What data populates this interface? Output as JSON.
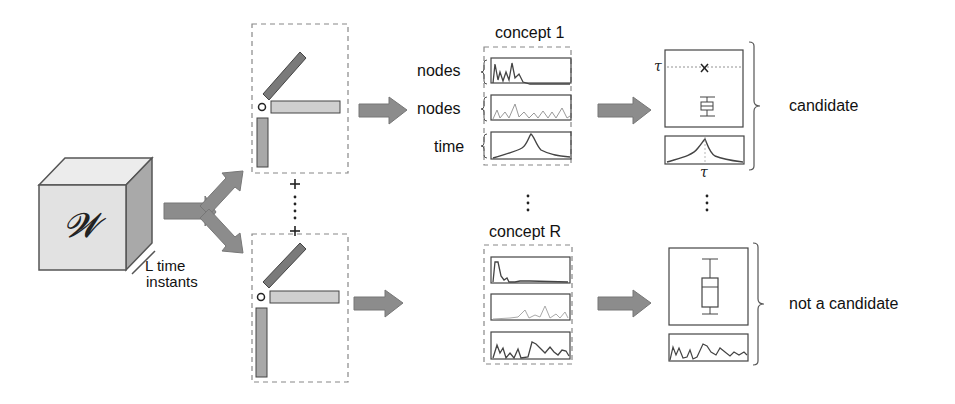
{
  "tensor": {
    "symbol": "𝓦",
    "mode_label": "L time\ninstants",
    "mode_label_line1": "L time",
    "mode_label_line2": "instants"
  },
  "decomposition": {
    "plus_symbol": "+",
    "ellipsis": "⋮",
    "components_shown": 2
  },
  "concepts": [
    {
      "title": "concept 1",
      "factor_labels": [
        "nodes",
        "nodes",
        "time"
      ],
      "outcome": "candidate"
    },
    {
      "title": "concept R",
      "factor_labels": [],
      "outcome": "not a candidate"
    }
  ],
  "threshold": {
    "symbol": "τ",
    "marker": "x"
  },
  "ellipsis": "⋮",
  "colors": {
    "arrow": "#8c8c8c",
    "dark_bar": "#7a7a7a",
    "light_bar": "#cfcfcf",
    "mid_bar": "#a8a8a8",
    "dashed": "#888888",
    "face_front": "#e2e2e2",
    "face_top": "#ececec",
    "face_side": "#a9a9a9"
  }
}
